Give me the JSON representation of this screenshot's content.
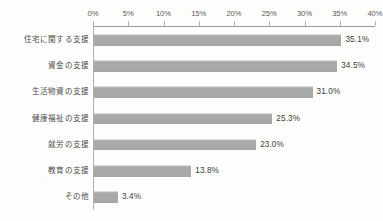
{
  "chart_data": {
    "type": "bar",
    "orientation": "horizontal",
    "title": "",
    "xlabel": "",
    "ylabel": "",
    "xlim": [
      0,
      40
    ],
    "grid": false,
    "legend": null,
    "tick_labels": [
      "0%",
      "5%",
      "10%",
      "15%",
      "20%",
      "25%",
      "30%",
      "35%",
      "40%"
    ],
    "tick_values": [
      0,
      5,
      10,
      15,
      20,
      25,
      30,
      35,
      40
    ],
    "categories": [
      "住宅に関する支援",
      "資金の支援",
      "生活物資の支援",
      "健康福祉の支援",
      "就労の支援",
      "教育の支援",
      "その他"
    ],
    "values": [
      35.1,
      34.5,
      31.0,
      25.3,
      23.0,
      13.8,
      3.4
    ],
    "value_labels": [
      "35.1%",
      "34.5%",
      "31.0%",
      "25.3%",
      "23.0%",
      "13.8%",
      "3.4%"
    ],
    "bar_color": "#a9a9a9",
    "axis_color": "#9a9a9a",
    "text_color": "#4e4e4e",
    "background_color": "#fdfdfc"
  }
}
